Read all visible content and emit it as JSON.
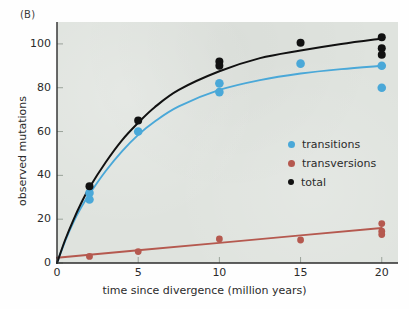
{
  "panel": {
    "label": "(B)"
  },
  "axes": {
    "y_title": "observed mutations",
    "x_title": "time since divergence (million years)",
    "y_ticks": [
      "0",
      "20",
      "40",
      "60",
      "80",
      "100"
    ],
    "x_ticks": [
      "0",
      "5",
      "10",
      "15",
      "20"
    ]
  },
  "legend": {
    "items": [
      {
        "label": "transitions",
        "color": "#4aa8d8"
      },
      {
        "label": "transversions",
        "color": "#b5594f"
      },
      {
        "label": "total",
        "color": "#111111"
      }
    ]
  },
  "colors": {
    "transitions": "#4aa8d8",
    "transversions": "#b5594f",
    "total": "#111111",
    "plot_background": "#dfe3de",
    "axis": "#2b2b2b"
  },
  "chart_data": {
    "type": "scatter",
    "title": "",
    "xlabel": "time since divergence (million years)",
    "ylabel": "observed mutations",
    "xlim": [
      0,
      21
    ],
    "ylim": [
      0,
      110
    ],
    "xticks": [
      0,
      5,
      10,
      15,
      20
    ],
    "yticks": [
      0,
      20,
      40,
      60,
      80,
      100
    ],
    "grid": false,
    "legend_position": "inside-right",
    "series": [
      {
        "name": "transitions",
        "color": "#4aa8d8",
        "points": [
          {
            "x": 2,
            "y": 32
          },
          {
            "x": 2,
            "y": 29
          },
          {
            "x": 5,
            "y": 60
          },
          {
            "x": 10,
            "y": 82
          },
          {
            "x": 10,
            "y": 78
          },
          {
            "x": 15,
            "y": 91
          },
          {
            "x": 20,
            "y": 90
          },
          {
            "x": 20,
            "y": 80
          }
        ],
        "fit": {
          "shape": "saturating",
          "points": [
            {
              "x": 0,
              "y": 0
            },
            {
              "x": 0.5,
              "y": 10
            },
            {
              "x": 1,
              "y": 18.5
            },
            {
              "x": 1.5,
              "y": 25.5
            },
            {
              "x": 2,
              "y": 31.5
            },
            {
              "x": 3,
              "y": 42
            },
            {
              "x": 4,
              "y": 51
            },
            {
              "x": 5,
              "y": 58.5
            },
            {
              "x": 6,
              "y": 64.5
            },
            {
              "x": 7.5,
              "y": 71.5
            },
            {
              "x": 10,
              "y": 79
            },
            {
              "x": 12.5,
              "y": 83.5
            },
            {
              "x": 15,
              "y": 86.5
            },
            {
              "x": 17.5,
              "y": 88.5
            },
            {
              "x": 20,
              "y": 90
            }
          ]
        }
      },
      {
        "name": "transversions",
        "color": "#b5594f",
        "points": [
          {
            "x": 2,
            "y": 3
          },
          {
            "x": 5,
            "y": 5.2
          },
          {
            "x": 10,
            "y": 11
          },
          {
            "x": 15,
            "y": 10.5
          },
          {
            "x": 20,
            "y": 18
          },
          {
            "x": 20,
            "y": 14.5
          },
          {
            "x": 20,
            "y": 13
          }
        ],
        "fit": {
          "shape": "linear",
          "points": [
            {
              "x": 0,
              "y": 2.4
            },
            {
              "x": 5,
              "y": 5.8
            },
            {
              "x": 10,
              "y": 9.2
            },
            {
              "x": 15,
              "y": 12.6
            },
            {
              "x": 20,
              "y": 16
            }
          ]
        }
      },
      {
        "name": "total",
        "color": "#111111",
        "points": [
          {
            "x": 2,
            "y": 35
          },
          {
            "x": 5,
            "y": 65
          },
          {
            "x": 10,
            "y": 92
          },
          {
            "x": 10,
            "y": 90
          },
          {
            "x": 15,
            "y": 100.5
          },
          {
            "x": 20,
            "y": 103
          },
          {
            "x": 20,
            "y": 98
          },
          {
            "x": 20,
            "y": 95
          }
        ],
        "fit": {
          "shape": "saturating",
          "points": [
            {
              "x": 0,
              "y": 0
            },
            {
              "x": 0.5,
              "y": 10.5
            },
            {
              "x": 1,
              "y": 19.5
            },
            {
              "x": 1.5,
              "y": 27.5
            },
            {
              "x": 2,
              "y": 34.5
            },
            {
              "x": 3,
              "y": 46
            },
            {
              "x": 4,
              "y": 56
            },
            {
              "x": 5,
              "y": 64
            },
            {
              "x": 6,
              "y": 71
            },
            {
              "x": 7.5,
              "y": 79
            },
            {
              "x": 10,
              "y": 87.5
            },
            {
              "x": 12.5,
              "y": 93.5
            },
            {
              "x": 15,
              "y": 97
            },
            {
              "x": 17.5,
              "y": 100
            },
            {
              "x": 20,
              "y": 102.5
            }
          ]
        }
      }
    ]
  }
}
